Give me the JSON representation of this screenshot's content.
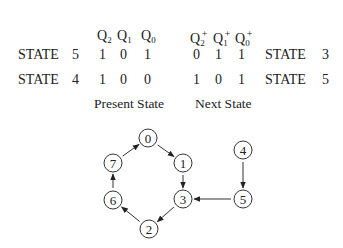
{
  "table": {
    "present_headers": [
      {
        "base": "Q",
        "sub": "2"
      },
      {
        "base": "Q",
        "sub": "1"
      },
      {
        "base": "Q",
        "sub": "0"
      }
    ],
    "next_headers": [
      {
        "base": "Q",
        "sub": "2",
        "sup": "+"
      },
      {
        "base": "Q",
        "sub": "1",
        "sup": "+"
      },
      {
        "base": "Q",
        "sub": "0",
        "sup": "+"
      }
    ],
    "rows": [
      {
        "label": "STATE",
        "state": "5",
        "present": [
          "1",
          "0",
          "1"
        ],
        "next": [
          "0",
          "1",
          "1"
        ],
        "next_label": "STATE",
        "next_state": "3"
      },
      {
        "label": "STATE",
        "state": "4",
        "present": [
          "1",
          "0",
          "0"
        ],
        "next": [
          "1",
          "0",
          "1"
        ],
        "next_label": "STATE",
        "next_state": "5"
      }
    ],
    "present_caption": "Present State",
    "next_caption": "Next State"
  },
  "diagram": {
    "nodes": [
      {
        "id": "0",
        "x": 148,
        "y": 138
      },
      {
        "id": "1",
        "x": 183,
        "y": 163
      },
      {
        "id": "3",
        "x": 183,
        "y": 199
      },
      {
        "id": "2",
        "x": 149,
        "y": 229
      },
      {
        "id": "6",
        "x": 113,
        "y": 200
      },
      {
        "id": "7",
        "x": 113,
        "y": 163
      },
      {
        "id": "4",
        "x": 243,
        "y": 150
      },
      {
        "id": "5",
        "x": 243,
        "y": 199
      }
    ],
    "edges": [
      {
        "from": "0",
        "to": "1"
      },
      {
        "from": "1",
        "to": "3"
      },
      {
        "from": "3",
        "to": "2"
      },
      {
        "from": "2",
        "to": "6"
      },
      {
        "from": "6",
        "to": "7"
      },
      {
        "from": "7",
        "to": "0"
      },
      {
        "from": "4",
        "to": "5"
      },
      {
        "from": "5",
        "to": "3"
      }
    ]
  }
}
